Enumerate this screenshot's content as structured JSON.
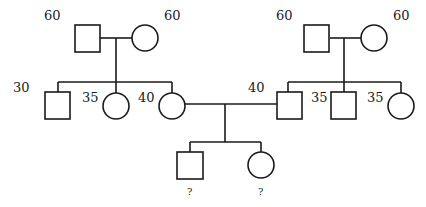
{
  "diagram": {
    "type": "pedigree",
    "individuals": [
      {
        "id": "gf-maternal",
        "sex": "male",
        "generation": 1,
        "label": "60"
      },
      {
        "id": "gm-maternal",
        "sex": "female",
        "generation": 1,
        "label": "60"
      },
      {
        "id": "gf-paternal",
        "sex": "male",
        "generation": 1,
        "label": "60"
      },
      {
        "id": "gm-paternal",
        "sex": "female",
        "generation": 1,
        "label": "60"
      },
      {
        "id": "uncle-maternal",
        "sex": "male",
        "generation": 2,
        "label": "30"
      },
      {
        "id": "aunt-maternal",
        "sex": "female",
        "generation": 2,
        "label": "35"
      },
      {
        "id": "mother",
        "sex": "female",
        "generation": 2,
        "label": "40"
      },
      {
        "id": "father",
        "sex": "male",
        "generation": 2,
        "label": "40"
      },
      {
        "id": "uncle-paternal",
        "sex": "male",
        "generation": 2,
        "label": "35"
      },
      {
        "id": "aunt-paternal",
        "sex": "female",
        "generation": 2,
        "label": "35"
      },
      {
        "id": "son",
        "sex": "male",
        "generation": 3,
        "label": "?"
      },
      {
        "id": "daughter",
        "sex": "female",
        "generation": 3,
        "label": "?"
      }
    ]
  }
}
